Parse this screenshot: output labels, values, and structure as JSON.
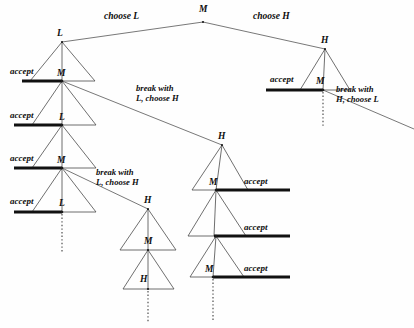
{
  "figure": {
    "type": "extensive-form-game-tree",
    "background_color": "#fefefe",
    "line_color": "#4a4a4a",
    "accept_bar_color": "#111111",
    "text_color": "#0d0d0d",
    "width": 414,
    "height": 328
  },
  "root": {
    "label": "M",
    "x": 203,
    "y": 14
  },
  "top_actions": {
    "left": "choose L",
    "right": "choose H"
  },
  "nodes": [
    {
      "id": "root-M",
      "label": "M",
      "x": 203,
      "y": 14,
      "player": "M"
    },
    {
      "id": "left-L",
      "label": "L",
      "x": 62,
      "y": 36,
      "player": "L"
    },
    {
      "id": "left-M1",
      "label": "M",
      "x": 62,
      "y": 76,
      "player": "M"
    },
    {
      "id": "left-L2",
      "label": "L",
      "x": 62,
      "y": 120,
      "player": "L"
    },
    {
      "id": "left-M2",
      "label": "M",
      "x": 62,
      "y": 163,
      "player": "M"
    },
    {
      "id": "left-L3",
      "label": "L",
      "x": 62,
      "y": 206,
      "player": "L"
    },
    {
      "id": "mid-H1",
      "label": "H",
      "x": 222,
      "y": 139,
      "player": "H"
    },
    {
      "id": "mid-M1",
      "label": "M",
      "x": 216,
      "y": 185,
      "player": "M"
    },
    {
      "id": "mid-M2",
      "label": "",
      "x": 216,
      "y": 231,
      "player": "M"
    },
    {
      "id": "mid-M3",
      "label": "M",
      "x": 216,
      "y": 272,
      "player": "M"
    },
    {
      "id": "lower-H1",
      "label": "H",
      "x": 148,
      "y": 203,
      "player": "H"
    },
    {
      "id": "lower-M1",
      "label": "M",
      "x": 148,
      "y": 244,
      "player": "M"
    },
    {
      "id": "lower-H2",
      "label": "H",
      "x": 148,
      "y": 282,
      "player": "H"
    },
    {
      "id": "right-H",
      "label": "H",
      "x": 325,
      "y": 43,
      "player": "H"
    },
    {
      "id": "right-M",
      "label": "M",
      "x": 325,
      "y": 84,
      "player": "M"
    }
  ],
  "accept_labels": [
    {
      "id": "accept-left-1",
      "text": "accept",
      "x": 28,
      "y": 74
    },
    {
      "id": "accept-left-2",
      "text": "accept",
      "x": 28,
      "y": 118
    },
    {
      "id": "accept-left-3",
      "text": "accept",
      "x": 28,
      "y": 161
    },
    {
      "id": "accept-left-4",
      "text": "accept",
      "x": 28,
      "y": 204
    },
    {
      "id": "accept-mid-1",
      "text": "accept",
      "x": 252,
      "y": 184
    },
    {
      "id": "accept-mid-2",
      "text": "accept",
      "x": 252,
      "y": 230
    },
    {
      "id": "accept-mid-3",
      "text": "accept",
      "x": 252,
      "y": 271
    },
    {
      "id": "accept-right",
      "text": "accept",
      "x": 276,
      "y": 82
    }
  ],
  "break_labels": [
    {
      "id": "break-1",
      "line1": "break with",
      "line2": "L, choose H",
      "x": 139,
      "y": 90
    },
    {
      "id": "break-2",
      "line1": "break with",
      "line2": "L, choose H",
      "x": 99,
      "y": 176
    },
    {
      "id": "break-3",
      "line1": "break with",
      "line2": "H, choose L",
      "x": 338,
      "y": 93
    }
  ],
  "node_labels_visible": [
    "M",
    "L",
    "H"
  ],
  "legend": {
    "accept": "accept",
    "break": "break with"
  }
}
